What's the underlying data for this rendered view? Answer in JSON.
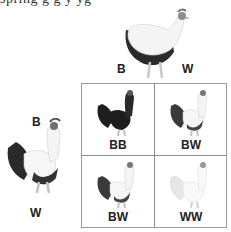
{
  "header_fragment": "spring g g y yg",
  "parents": {
    "hen": {
      "name": "hen",
      "alleles": [
        "B",
        "W"
      ]
    },
    "rooster": {
      "name": "rooster",
      "alleles": [
        "B",
        "W"
      ]
    }
  },
  "punnett": {
    "cells": [
      {
        "genotype": "BB",
        "shade": "black"
      },
      {
        "genotype": "BW",
        "shade": "blue"
      },
      {
        "genotype": "BW",
        "shade": "blue"
      },
      {
        "genotype": "WW",
        "shade": "white"
      }
    ]
  },
  "colors": {
    "black": "#1e1e1e",
    "blue": "#4a4a4a",
    "white": "#d8d8d8",
    "grid_line": "#8a8a8a"
  }
}
